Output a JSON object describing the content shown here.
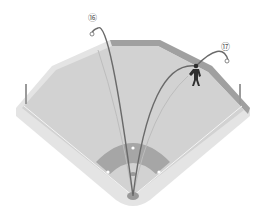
{
  "diagram": {
    "labels": [
      {
        "id": "trajectory-16",
        "text": "⑯"
      },
      {
        "id": "trajectory-17",
        "text": "⑰"
      }
    ],
    "colors": {
      "field": "#d4d4d4",
      "field_edge": "#e2e2e2",
      "wall": "#9a9a9a",
      "infield_dirt": "#a8a8a8",
      "trajectory": "#6a6a6a",
      "fielder": "#2e2e2e",
      "lines": "#ffffff"
    }
  }
}
